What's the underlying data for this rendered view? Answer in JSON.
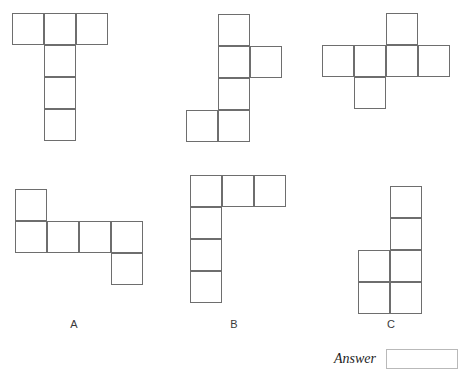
{
  "page": {
    "background_color": "#ffffff",
    "cell_size": 32,
    "cell_border_color": "#6e6e6e"
  },
  "shapes": [
    {
      "id": "shape-top-left",
      "label": "",
      "origin": {
        "x": 12,
        "y": 13
      },
      "cells": [
        {
          "col": 0,
          "row": 0
        },
        {
          "col": 1,
          "row": 0
        },
        {
          "col": 2,
          "row": 0
        },
        {
          "col": 1,
          "row": 1
        },
        {
          "col": 1,
          "row": 2
        },
        {
          "col": 1,
          "row": 3
        }
      ]
    },
    {
      "id": "shape-top-middle",
      "label": "",
      "origin": {
        "x": 186,
        "y": 14
      },
      "cells": [
        {
          "col": 1,
          "row": 0
        },
        {
          "col": 1,
          "row": 1
        },
        {
          "col": 2,
          "row": 1
        },
        {
          "col": 1,
          "row": 2
        },
        {
          "col": 0,
          "row": 3
        },
        {
          "col": 1,
          "row": 3
        }
      ]
    },
    {
      "id": "shape-top-right",
      "label": "",
      "origin": {
        "x": 322,
        "y": 13
      },
      "cells": [
        {
          "col": 2,
          "row": 0
        },
        {
          "col": 0,
          "row": 1
        },
        {
          "col": 1,
          "row": 1
        },
        {
          "col": 2,
          "row": 1
        },
        {
          "col": 3,
          "row": 1
        },
        {
          "col": 1,
          "row": 2
        }
      ]
    },
    {
      "id": "shape-option-a",
      "label": "A",
      "label_pos": {
        "x": 59,
        "y": 318
      },
      "origin": {
        "x": 15,
        "y": 189
      },
      "cells": [
        {
          "col": 0,
          "row": 0
        },
        {
          "col": 0,
          "row": 1
        },
        {
          "col": 1,
          "row": 1
        },
        {
          "col": 2,
          "row": 1
        },
        {
          "col": 3,
          "row": 1
        },
        {
          "col": 3,
          "row": 2
        }
      ]
    },
    {
      "id": "shape-option-b",
      "label": "B",
      "label_pos": {
        "x": 219,
        "y": 318
      },
      "origin": {
        "x": 190,
        "y": 175
      },
      "cells": [
        {
          "col": 0,
          "row": 0
        },
        {
          "col": 1,
          "row": 0
        },
        {
          "col": 2,
          "row": 0
        },
        {
          "col": 0,
          "row": 1
        },
        {
          "col": 0,
          "row": 2
        },
        {
          "col": 0,
          "row": 3
        }
      ]
    },
    {
      "id": "shape-option-c",
      "label": "C",
      "label_pos": {
        "x": 376,
        "y": 318
      },
      "origin": {
        "x": 358,
        "y": 186
      },
      "cells": [
        {
          "col": 1,
          "row": 0
        },
        {
          "col": 1,
          "row": 1
        },
        {
          "col": 0,
          "row": 2
        },
        {
          "col": 1,
          "row": 2
        },
        {
          "col": 0,
          "row": 3
        },
        {
          "col": 1,
          "row": 3
        }
      ]
    }
  ],
  "answer": {
    "label": "Answer",
    "value": "",
    "placeholder": ""
  }
}
